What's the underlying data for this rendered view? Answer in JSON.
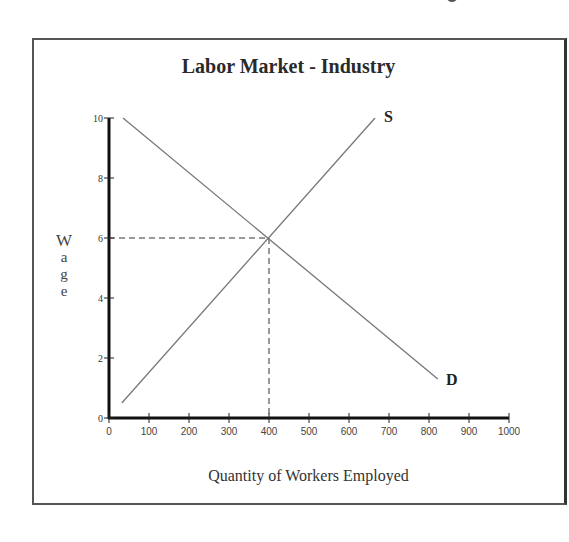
{
  "chart_data": {
    "type": "line",
    "title": "Labor Market - Industry",
    "xlabel": "Quantity of Workers Employed",
    "ylabel": "Wage",
    "xlim": [
      0,
      1000
    ],
    "ylim": [
      0,
      10
    ],
    "x_ticks": [
      0,
      100,
      200,
      300,
      400,
      500,
      600,
      700,
      800,
      900,
      1000
    ],
    "y_ticks": [
      0,
      2,
      4,
      6,
      8,
      10
    ],
    "grid": false,
    "legend": "none",
    "series": [
      {
        "name": "S",
        "label": "S",
        "points": [
          [
            32,
            0.5
          ],
          [
            665,
            10
          ]
        ]
      },
      {
        "name": "D",
        "label": "D",
        "points": [
          [
            35,
            10
          ],
          [
            822,
            1.3
          ]
        ]
      }
    ],
    "equilibrium": {
      "x": 400,
      "y": 6,
      "dashed_guides": true
    }
  },
  "labels": {
    "title": "Labor Market - Industry",
    "xlabel": "Quantity of Workers Employed",
    "ylabel_letters": [
      "W",
      "a",
      "g",
      "e"
    ],
    "supply": "S",
    "demand": "D"
  }
}
